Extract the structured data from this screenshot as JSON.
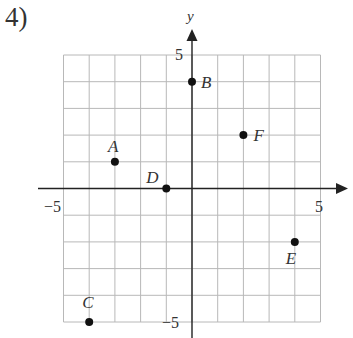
{
  "problem": {
    "number": "4)"
  },
  "chart_data": {
    "type": "scatter",
    "title": "",
    "xlabel": "",
    "ylabel": "y",
    "xlim": [
      -5,
      5
    ],
    "ylim": [
      -5,
      5
    ],
    "grid": true,
    "grid_step": 1,
    "tick_labels": {
      "x_min": "−5",
      "x_max": "5",
      "y_min": "−5",
      "y_max": "5"
    },
    "points": [
      {
        "label": "A",
        "x": -3,
        "y": 1
      },
      {
        "label": "B",
        "x": 0,
        "y": 4
      },
      {
        "label": "C",
        "x": -4,
        "y": -5
      },
      {
        "label": "D",
        "x": -1,
        "y": 0
      },
      {
        "label": "E",
        "x": 4,
        "y": -2
      },
      {
        "label": "F",
        "x": 2,
        "y": 2
      }
    ]
  }
}
